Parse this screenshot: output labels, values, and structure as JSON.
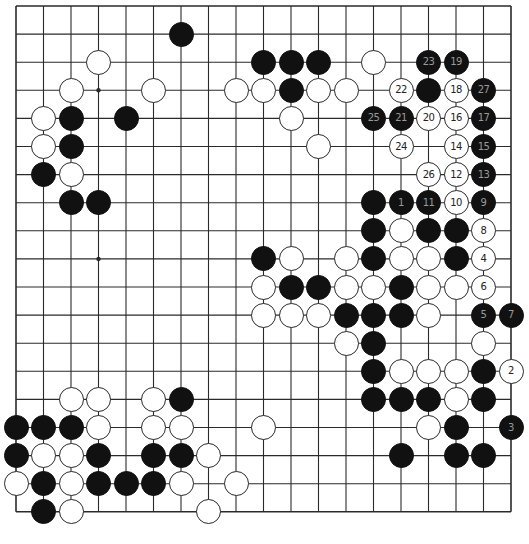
{
  "board": {
    "size": 19,
    "origin_x": 16,
    "origin_y": 6,
    "spacing_x": 27.5,
    "spacing_y": 28.1,
    "line_color": "#2a2a2a",
    "star_points": [
      [
        3,
        3
      ],
      [
        9,
        3
      ],
      [
        15,
        3
      ],
      [
        3,
        9
      ],
      [
        9,
        9
      ],
      [
        15,
        9
      ],
      [
        3,
        15
      ],
      [
        9,
        15
      ],
      [
        15,
        15
      ]
    ]
  },
  "stones": [
    {
      "c": 6,
      "r": 1,
      "color": "b"
    },
    {
      "c": 3,
      "r": 2,
      "color": "w"
    },
    {
      "c": 9,
      "r": 2,
      "color": "b"
    },
    {
      "c": 10,
      "r": 2,
      "color": "b"
    },
    {
      "c": 11,
      "r": 2,
      "color": "b"
    },
    {
      "c": 13,
      "r": 2,
      "color": "w"
    },
    {
      "c": 15,
      "r": 2,
      "color": "b",
      "label": "23"
    },
    {
      "c": 16,
      "r": 2,
      "color": "b",
      "label": "19"
    },
    {
      "c": 2,
      "r": 3,
      "color": "w"
    },
    {
      "c": 5,
      "r": 3,
      "color": "w"
    },
    {
      "c": 8,
      "r": 3,
      "color": "w"
    },
    {
      "c": 9,
      "r": 3,
      "color": "w"
    },
    {
      "c": 10,
      "r": 3,
      "color": "b"
    },
    {
      "c": 11,
      "r": 3,
      "color": "w"
    },
    {
      "c": 12,
      "r": 3,
      "color": "w"
    },
    {
      "c": 14,
      "r": 3,
      "color": "w",
      "label": "22"
    },
    {
      "c": 15,
      "r": 3,
      "color": "b"
    },
    {
      "c": 16,
      "r": 3,
      "color": "w",
      "label": "18"
    },
    {
      "c": 17,
      "r": 3,
      "color": "b",
      "label": "27"
    },
    {
      "c": 1,
      "r": 4,
      "color": "w"
    },
    {
      "c": 2,
      "r": 4,
      "color": "b"
    },
    {
      "c": 4,
      "r": 4,
      "color": "b"
    },
    {
      "c": 10,
      "r": 4,
      "color": "w"
    },
    {
      "c": 13,
      "r": 4,
      "color": "b",
      "label": "25"
    },
    {
      "c": 14,
      "r": 4,
      "color": "b",
      "label": "21"
    },
    {
      "c": 15,
      "r": 4,
      "color": "w",
      "label": "20"
    },
    {
      "c": 16,
      "r": 4,
      "color": "w",
      "label": "16"
    },
    {
      "c": 17,
      "r": 4,
      "color": "b",
      "label": "17"
    },
    {
      "c": 1,
      "r": 5,
      "color": "w"
    },
    {
      "c": 2,
      "r": 5,
      "color": "b"
    },
    {
      "c": 11,
      "r": 5,
      "color": "w"
    },
    {
      "c": 14,
      "r": 5,
      "color": "w",
      "label": "24"
    },
    {
      "c": 16,
      "r": 5,
      "color": "w",
      "label": "14"
    },
    {
      "c": 17,
      "r": 5,
      "color": "b",
      "label": "15"
    },
    {
      "c": 1,
      "r": 6,
      "color": "b"
    },
    {
      "c": 2,
      "r": 6,
      "color": "w"
    },
    {
      "c": 15,
      "r": 6,
      "color": "w",
      "label": "26"
    },
    {
      "c": 16,
      "r": 6,
      "color": "w",
      "label": "12"
    },
    {
      "c": 17,
      "r": 6,
      "color": "b",
      "label": "13"
    },
    {
      "c": 2,
      "r": 7,
      "color": "b"
    },
    {
      "c": 3,
      "r": 7,
      "color": "b"
    },
    {
      "c": 13,
      "r": 7,
      "color": "b"
    },
    {
      "c": 14,
      "r": 7,
      "color": "b",
      "label": "1"
    },
    {
      "c": 15,
      "r": 7,
      "color": "b",
      "label": "11"
    },
    {
      "c": 16,
      "r": 7,
      "color": "w",
      "label": "10"
    },
    {
      "c": 17,
      "r": 7,
      "color": "b",
      "label": "9"
    },
    {
      "c": 13,
      "r": 8,
      "color": "b"
    },
    {
      "c": 14,
      "r": 8,
      "color": "w"
    },
    {
      "c": 15,
      "r": 8,
      "color": "b"
    },
    {
      "c": 16,
      "r": 8,
      "color": "b"
    },
    {
      "c": 17,
      "r": 8,
      "color": "w",
      "label": "8"
    },
    {
      "c": 9,
      "r": 9,
      "color": "b"
    },
    {
      "c": 10,
      "r": 9,
      "color": "w"
    },
    {
      "c": 12,
      "r": 9,
      "color": "w"
    },
    {
      "c": 13,
      "r": 9,
      "color": "b"
    },
    {
      "c": 14,
      "r": 9,
      "color": "w"
    },
    {
      "c": 15,
      "r": 9,
      "color": "w"
    },
    {
      "c": 16,
      "r": 9,
      "color": "b"
    },
    {
      "c": 17,
      "r": 9,
      "color": "w",
      "label": "4"
    },
    {
      "c": 9,
      "r": 10,
      "color": "w"
    },
    {
      "c": 10,
      "r": 10,
      "color": "b"
    },
    {
      "c": 11,
      "r": 10,
      "color": "b"
    },
    {
      "c": 12,
      "r": 10,
      "color": "w"
    },
    {
      "c": 13,
      "r": 10,
      "color": "w"
    },
    {
      "c": 14,
      "r": 10,
      "color": "b"
    },
    {
      "c": 15,
      "r": 10,
      "color": "w"
    },
    {
      "c": 16,
      "r": 10,
      "color": "w"
    },
    {
      "c": 17,
      "r": 10,
      "color": "w",
      "label": "6"
    },
    {
      "c": 9,
      "r": 11,
      "color": "w"
    },
    {
      "c": 10,
      "r": 11,
      "color": "w"
    },
    {
      "c": 11,
      "r": 11,
      "color": "w"
    },
    {
      "c": 12,
      "r": 11,
      "color": "b"
    },
    {
      "c": 13,
      "r": 11,
      "color": "b"
    },
    {
      "c": 14,
      "r": 11,
      "color": "b"
    },
    {
      "c": 15,
      "r": 11,
      "color": "w"
    },
    {
      "c": 17,
      "r": 11,
      "color": "b",
      "label": "5"
    },
    {
      "c": 18,
      "r": 11,
      "color": "b",
      "label": "7"
    },
    {
      "c": 12,
      "r": 12,
      "color": "w"
    },
    {
      "c": 13,
      "r": 12,
      "color": "b"
    },
    {
      "c": 17,
      "r": 12,
      "color": "w"
    },
    {
      "c": 13,
      "r": 13,
      "color": "b"
    },
    {
      "c": 14,
      "r": 13,
      "color": "w"
    },
    {
      "c": 15,
      "r": 13,
      "color": "w"
    },
    {
      "c": 16,
      "r": 13,
      "color": "w"
    },
    {
      "c": 17,
      "r": 13,
      "color": "b"
    },
    {
      "c": 18,
      "r": 13,
      "color": "w",
      "label": "2"
    },
    {
      "c": 2,
      "r": 14,
      "color": "w"
    },
    {
      "c": 3,
      "r": 14,
      "color": "w"
    },
    {
      "c": 5,
      "r": 14,
      "color": "w"
    },
    {
      "c": 6,
      "r": 14,
      "color": "b"
    },
    {
      "c": 13,
      "r": 14,
      "color": "b"
    },
    {
      "c": 14,
      "r": 14,
      "color": "b"
    },
    {
      "c": 15,
      "r": 14,
      "color": "b"
    },
    {
      "c": 16,
      "r": 14,
      "color": "w"
    },
    {
      "c": 17,
      "r": 14,
      "color": "b"
    },
    {
      "c": 0,
      "r": 15,
      "color": "b"
    },
    {
      "c": 1,
      "r": 15,
      "color": "b"
    },
    {
      "c": 2,
      "r": 15,
      "color": "b"
    },
    {
      "c": 3,
      "r": 15,
      "color": "w"
    },
    {
      "c": 5,
      "r": 15,
      "color": "w"
    },
    {
      "c": 6,
      "r": 15,
      "color": "w"
    },
    {
      "c": 9,
      "r": 15,
      "color": "w"
    },
    {
      "c": 15,
      "r": 15,
      "color": "w"
    },
    {
      "c": 16,
      "r": 15,
      "color": "b"
    },
    {
      "c": 18,
      "r": 15,
      "color": "b",
      "label": "3"
    },
    {
      "c": 0,
      "r": 16,
      "color": "b"
    },
    {
      "c": 1,
      "r": 16,
      "color": "w"
    },
    {
      "c": 2,
      "r": 16,
      "color": "w"
    },
    {
      "c": 3,
      "r": 16,
      "color": "b"
    },
    {
      "c": 5,
      "r": 16,
      "color": "b"
    },
    {
      "c": 6,
      "r": 16,
      "color": "b"
    },
    {
      "c": 7,
      "r": 16,
      "color": "w"
    },
    {
      "c": 14,
      "r": 16,
      "color": "b"
    },
    {
      "c": 16,
      "r": 16,
      "color": "b"
    },
    {
      "c": 17,
      "r": 16,
      "color": "b"
    },
    {
      "c": 0,
      "r": 17,
      "color": "w"
    },
    {
      "c": 1,
      "r": 17,
      "color": "b"
    },
    {
      "c": 2,
      "r": 17,
      "color": "w"
    },
    {
      "c": 3,
      "r": 17,
      "color": "b"
    },
    {
      "c": 4,
      "r": 17,
      "color": "b"
    },
    {
      "c": 5,
      "r": 17,
      "color": "b"
    },
    {
      "c": 6,
      "r": 17,
      "color": "w"
    },
    {
      "c": 8,
      "r": 17,
      "color": "w"
    },
    {
      "c": 1,
      "r": 18,
      "color": "b"
    },
    {
      "c": 2,
      "r": 18,
      "color": "w"
    },
    {
      "c": 7,
      "r": 18,
      "color": "w"
    }
  ]
}
